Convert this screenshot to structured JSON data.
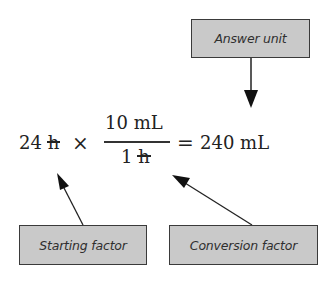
{
  "diagram": {
    "type": "unit-conversion-equation",
    "labels": {
      "answer_unit": "Answer unit",
      "starting_factor": "Starting factor",
      "conversion_factor": "Conversion factor"
    },
    "equation": {
      "starting_value": "24",
      "starting_unit": "h",
      "times_symbol": "×",
      "numerator_value": "10",
      "numerator_unit": "mL",
      "denominator_value": "1",
      "denominator_unit": "h",
      "equals_symbol": "=",
      "result_value": "240",
      "result_unit": "mL"
    },
    "arrows": [
      {
        "from": "answer_unit",
        "to": "result_unit"
      },
      {
        "from": "starting_factor",
        "to": "starting_value"
      },
      {
        "from": "conversion_factor",
        "to": "fraction"
      }
    ],
    "colors": {
      "box_fill": "#c9c9c9",
      "box_border": "#3a3a3a",
      "text": "#222222",
      "arrow": "#222222"
    }
  }
}
